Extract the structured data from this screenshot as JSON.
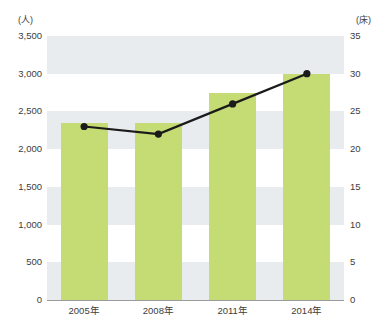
{
  "chart_data": {
    "type": "bar",
    "title": "",
    "subtitle": "",
    "xlabel": "",
    "categories": [
      "2005年",
      "2008年",
      "2011年",
      "2014年"
    ],
    "grid": true,
    "legend_position": "none",
    "annotations": [],
    "axes": {
      "left": {
        "unit": "(人)",
        "ylabel": "",
        "ylim": [
          0,
          3500
        ],
        "tick_step": 500,
        "ticks": [
          "0",
          "500",
          "1,000",
          "1,500",
          "2,000",
          "2,500",
          "3,000",
          "3,500"
        ],
        "tick_values": [
          0,
          500,
          1000,
          1500,
          2000,
          2500,
          3000,
          3500
        ]
      },
      "right": {
        "unit": "(床)",
        "ylabel": "",
        "ylim": [
          0,
          35
        ],
        "tick_step": 5,
        "ticks": [
          "0",
          "5",
          "10",
          "15",
          "20",
          "25",
          "30",
          "35"
        ],
        "tick_values": [
          0,
          5,
          10,
          15,
          20,
          25,
          30,
          35
        ]
      }
    },
    "series": [
      {
        "name": "人",
        "type": "bar",
        "axis": "left",
        "color": "#c5dc74",
        "values": [
          2350,
          2350,
          2750,
          3000
        ]
      },
      {
        "name": "床",
        "type": "line",
        "axis": "right",
        "color": "#1b1b1b",
        "marker": "circle",
        "values": [
          23,
          22,
          26,
          30
        ]
      }
    ]
  },
  "colors": {
    "bar_green": "#c5dc74",
    "band_gray": "#e8ecee",
    "line_black": "#1b1b1b",
    "text": "#3d3d3d",
    "axis": "#9b9b9b",
    "background": "#ffffff"
  }
}
